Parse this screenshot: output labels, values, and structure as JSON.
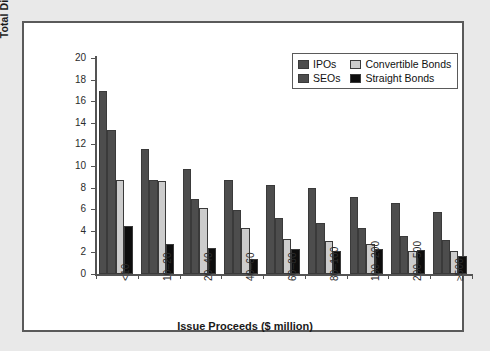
{
  "chart_data": {
    "type": "bar",
    "title": "",
    "xlabel": "Issue Proceeds ($ million)",
    "ylabel": "Total Direct Costs (%)",
    "ylim": [
      0,
      20
    ],
    "yticks": [
      0,
      2,
      4,
      6,
      8,
      10,
      12,
      14,
      16,
      18,
      20
    ],
    "grid": false,
    "legend_position": "top-right",
    "categories": [
      "<10",
      "10–20",
      "20–40",
      "40–60",
      "60–80",
      "80–100",
      "100–200",
      "200–500",
      "≥500"
    ],
    "series": [
      {
        "name": "IPOs",
        "color": "#4d4d4d",
        "values": [
          16.95,
          11.6,
          9.7,
          8.75,
          8.25,
          7.95,
          7.1,
          6.55,
          5.75
        ]
      },
      {
        "name": "SEOs",
        "color": "#4d4d4d",
        "values": [
          13.3,
          8.7,
          6.95,
          5.9,
          5.2,
          4.75,
          4.25,
          3.5,
          3.15
        ]
      },
      {
        "name": "Convertible Bonds",
        "color": "#cccccc",
        "values": [
          8.75,
          8.65,
          6.1,
          4.3,
          3.2,
          3.05,
          2.75,
          2.15,
          2.1
        ]
      },
      {
        "name": "Straight Bonds",
        "color": "#0d0d0d",
        "values": [
          4.4,
          2.75,
          2.4,
          1.35,
          2.35,
          2.15,
          2.3,
          2.2,
          1.65
        ]
      }
    ]
  },
  "legend": {
    "items": [
      {
        "label": "IPOs",
        "color": "#4d4d4d"
      },
      {
        "label": "Convertible Bonds",
        "color": "#cccccc"
      },
      {
        "label": "SEOs",
        "color": "#4d4d4d"
      },
      {
        "label": "Straight Bonds",
        "color": "#0d0d0d"
      }
    ]
  },
  "axes": {
    "y_title": "Total Direct Costs (%)",
    "x_title": "Issue Proceeds ($ million)"
  },
  "colors": {
    "page_background": "#e9e9e9",
    "panel_background": "#ffffff",
    "panel_border": "#5a5a5a",
    "axis": "#545454",
    "bar_outline": "#3a3a3a"
  }
}
